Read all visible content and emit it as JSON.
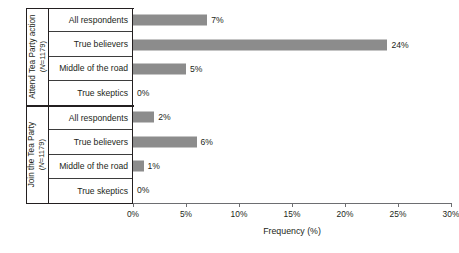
{
  "chart_data": {
    "type": "bar",
    "orientation": "horizontal",
    "title": "",
    "xlabel": "Frequency (%)",
    "ylabel": "",
    "xlim": [
      0,
      30
    ],
    "xticks": [
      0,
      5,
      10,
      15,
      20,
      25,
      30
    ],
    "xtick_labels": [
      "0%",
      "5%",
      "10%",
      "15%",
      "20%",
      "25%",
      "30%"
    ],
    "grid": false,
    "legend": null,
    "bar_color": "#8c8c8c",
    "groups": [
      {
        "label": "Attend Tea Party action",
        "n_label": "(N=1179)",
        "n_prefix": "N",
        "n_value": "=1179)",
        "categories": [
          "All respondents",
          "True believers",
          "Middle of the road",
          "True skeptics"
        ],
        "values": [
          7,
          24,
          5,
          0
        ],
        "value_labels": [
          "7%",
          "24%",
          "5%",
          "0%"
        ]
      },
      {
        "label": "Join the Tea Party",
        "n_label": "(N=1179)",
        "n_prefix": "N",
        "n_value": "=1179)",
        "categories": [
          "All respondents",
          "True believers",
          "Middle of the road",
          "True skeptics"
        ],
        "values": [
          2,
          6,
          1,
          0
        ],
        "value_labels": [
          "2%",
          "6%",
          "1%",
          "0%"
        ]
      }
    ]
  }
}
